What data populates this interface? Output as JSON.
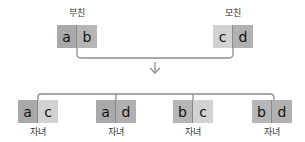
{
  "colors": {
    "a": "#a9a9a9",
    "b": "#b6b6b6",
    "c": "#d2d2d2",
    "d": "#b1b1b1",
    "line": "#8c8c8c"
  },
  "parents": [
    {
      "label": "부친",
      "alleles": [
        "a",
        "b"
      ]
    },
    {
      "label": "모친",
      "alleles": [
        "c",
        "d"
      ]
    }
  ],
  "children": [
    {
      "label": "자녀",
      "alleles": [
        "a",
        "c"
      ]
    },
    {
      "label": "자녀",
      "alleles": [
        "a",
        "d"
      ]
    },
    {
      "label": "자녀",
      "alleles": [
        "b",
        "c"
      ]
    },
    {
      "label": "자녀",
      "alleles": [
        "b",
        "d"
      ]
    }
  ],
  "icons": {
    "arrow": "arrow-down-icon"
  }
}
